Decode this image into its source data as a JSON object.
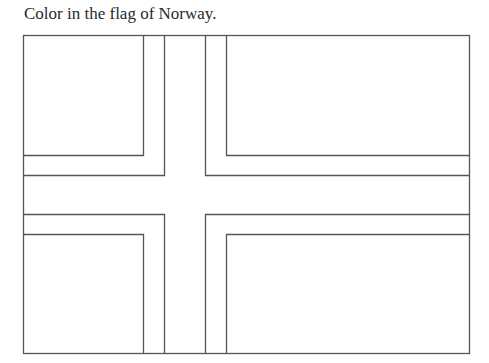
{
  "instruction": "Color in the flag of Norway.",
  "flag": {
    "country": "Norway",
    "outline_color": "#555555",
    "fill_color": "#ffffff"
  }
}
